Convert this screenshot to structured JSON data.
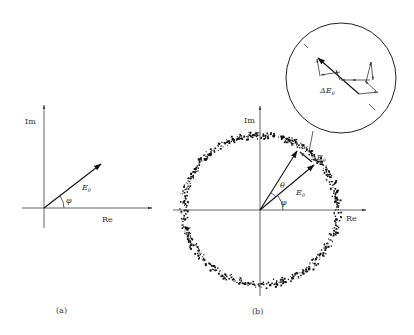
{
  "figure": {
    "panel_a": {
      "caption": "(a)",
      "axis_labels": {
        "imag": "Im",
        "real": "Re"
      },
      "vector_label": "E",
      "vector_subscript": "0",
      "angle_label": "φ"
    },
    "panel_b": {
      "caption": "(b)",
      "axis_labels": {
        "imag": "Im",
        "real": "Re"
      },
      "vector_label": "E",
      "vector_subscript": "0",
      "angle_phi_label": "φ",
      "angle_theta_label": "θ",
      "delta_label": "ΔE",
      "delta_subscript": "θ",
      "noise_ring": {
        "radius": 77,
        "thickness": 9,
        "points": 700,
        "seed": 7
      }
    },
    "inset": {
      "delta_label": "ΔE",
      "delta_subscript": "θ"
    },
    "colors": {
      "ink": "#111111",
      "axis": "#555555",
      "label": "#333333",
      "background": "#ffffff"
    }
  }
}
